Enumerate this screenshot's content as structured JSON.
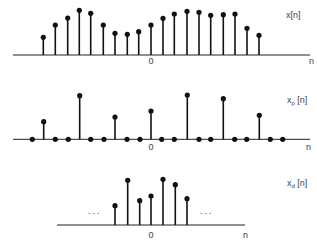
{
  "chart_data": [
    {
      "id": "panel-x",
      "type": "stem",
      "signal_label": "x[n]",
      "label_main": "x",
      "label_sub": "",
      "label_suffix": "[n]",
      "axis_label": "n",
      "origin_label": "0",
      "baseline_y": 55,
      "zero_x": 151,
      "axis_x": [
        13,
        310
      ],
      "label_pos": [
        286,
        18
      ],
      "axis_label_pos": [
        309,
        64
      ],
      "origin_label_pos": [
        151,
        64
      ],
      "n": [
        -9,
        -8,
        -7,
        -6,
        -5,
        -4,
        -3,
        -2,
        -1,
        0,
        1,
        2,
        3,
        4,
        5,
        6,
        7,
        8,
        9
      ],
      "x_px": [
        43.3,
        55.3,
        67.7,
        79.3,
        90.7,
        103.3,
        115,
        127.3,
        138.7,
        151,
        163,
        174.3,
        187,
        199,
        210.7,
        223.3,
        235,
        247,
        259
      ],
      "values": [
        17.7,
        30,
        37,
        44.7,
        41.7,
        30,
        21.7,
        20.7,
        23.3,
        30,
        36.7,
        41,
        43.7,
        42.7,
        39.7,
        40.3,
        41,
        26.7,
        19.7
      ],
      "show_zero_dots": false
    },
    {
      "id": "panel-xp",
      "type": "stem",
      "signal_label": "xp[n]",
      "label_main": "x",
      "label_sub": "p",
      "label_suffix": " [n]",
      "axis_label": "n",
      "origin_label": "0",
      "baseline_y": 139.3,
      "zero_x": 151,
      "axis_x": [
        13,
        310
      ],
      "label_pos": [
        287,
        103
      ],
      "axis_label_pos": [
        306,
        150
      ],
      "origin_label_pos": [
        151,
        150
      ],
      "n": [
        -10,
        -9,
        -8,
        -7,
        -6,
        -5,
        -4,
        -3,
        -2,
        -1,
        0,
        1,
        2,
        3,
        4,
        5,
        6,
        7,
        8,
        9,
        10,
        11
      ],
      "x_px": [
        32.3,
        43.7,
        55.3,
        68.3,
        79.7,
        90.7,
        104,
        115,
        127,
        140,
        151,
        161.7,
        174.3,
        187.3,
        199,
        210.7,
        223.3,
        234.7,
        246.7,
        259.3,
        270.3,
        282.7
      ],
      "values": [
        0,
        17.6,
        0,
        0,
        43.6,
        0,
        0,
        22.3,
        0,
        0,
        28.3,
        0,
        0,
        44.3,
        0,
        0,
        40.6,
        0,
        0,
        24,
        0,
        0
      ],
      "show_zero_dots": true
    },
    {
      "id": "panel-xd",
      "type": "stem",
      "signal_label": "xd[n]",
      "label_main": "x",
      "label_sub": "d",
      "label_suffix": " [n]",
      "axis_label": "n",
      "origin_label": "0",
      "baseline_y": 225,
      "zero_x": 151,
      "axis_x": [
        57,
        245
      ],
      "label_pos": [
        287,
        186
      ],
      "axis_label_pos": [
        243,
        238
      ],
      "origin_label_pos": [
        151,
        238
      ],
      "n": [
        -3,
        -2,
        -1,
        0,
        1,
        2,
        3
      ],
      "x_px": [
        115,
        127.7,
        139.7,
        151,
        163,
        175.3,
        187
      ],
      "values": [
        19.3,
        44.7,
        24.3,
        29,
        45.7,
        40.3,
        26.3
      ],
      "show_zero_dots": false,
      "ellipsis": [
        {
          "text": "...",
          "x": 88,
          "y": 214
        },
        {
          "text": "...",
          "x": 200,
          "y": 214
        }
      ]
    }
  ]
}
